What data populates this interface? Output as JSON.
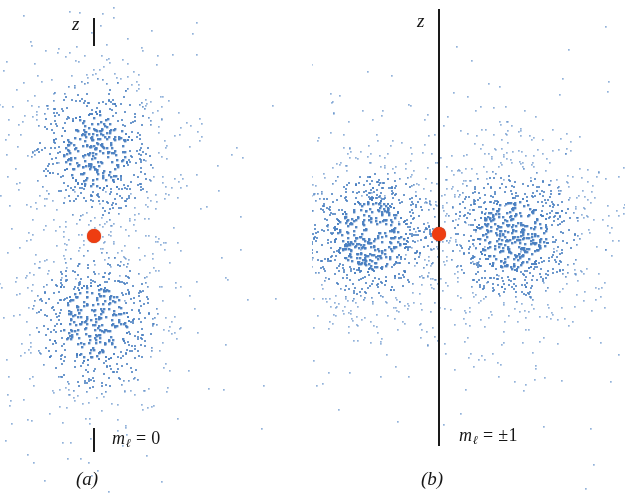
{
  "figure": {
    "width": 625,
    "height": 499,
    "background": "#ffffff",
    "dot_color": "#4a7fc1",
    "nucleus_color": "#ee3d11",
    "axis_color": "#1a1a1a"
  },
  "panels": [
    {
      "id": "a",
      "caption": "(a)",
      "axis_label": "z",
      "quantum_label": {
        "symbol": "m",
        "subscript": "ℓ",
        "equals": "=",
        "value": "0"
      },
      "quantum_label_text": "mℓ = 0",
      "axis_style": "tick-segments",
      "lobe_orientation": "vertical"
    },
    {
      "id": "b",
      "caption": "(b)",
      "axis_label": "z",
      "quantum_label": {
        "symbol": "m",
        "subscript": "ℓ",
        "equals": "=",
        "value": "±1"
      },
      "quantum_label_text": "mℓ = ±1",
      "axis_style": "continuous-line",
      "lobe_orientation": "horizontal"
    }
  ],
  "chart_data": {
    "type": "scatter",
    "title": "",
    "xlabel": "",
    "ylabel": "z",
    "grid": false,
    "legend": null,
    "series": [
      {
        "name": "m_l = 0 probability cloud",
        "panel": "a",
        "n_points": 1500,
        "lobes": [
          {
            "center_x": 94,
            "center_y": 150,
            "sigma_x": 58,
            "sigma_y": 66
          },
          {
            "center_x": 94,
            "center_y": 322,
            "sigma_x": 58,
            "sigma_y": 66
          }
        ]
      },
      {
        "name": "m_l = +/-1 probability cloud",
        "panel": "b",
        "n_points": 2000,
        "lobes": [
          {
            "center_x": 370,
            "center_y": 234,
            "sigma_x": 62,
            "sigma_y": 62
          },
          {
            "center_x": 512,
            "center_y": 234,
            "sigma_x": 62,
            "sigma_y": 62
          }
        ]
      }
    ],
    "nuclei": [
      {
        "panel": "a",
        "x": 94,
        "y": 236,
        "radius": 7,
        "color": "#ee3d11"
      },
      {
        "panel": "b",
        "x": 439,
        "y": 234,
        "radius": 7,
        "color": "#ee3d11"
      }
    ],
    "axes": [
      {
        "panel": "a",
        "x": 94,
        "segments": [
          [
            18,
            46
          ],
          [
            428,
            452
          ]
        ]
      },
      {
        "panel": "b",
        "x": 439,
        "segments": [
          [
            9,
            446
          ]
        ]
      }
    ]
  }
}
